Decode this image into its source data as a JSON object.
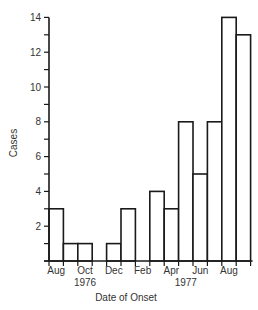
{
  "chart_data": {
    "type": "bar",
    "title": "",
    "xlabel": "Date of Onset",
    "ylabel": "Cases",
    "ylim": [
      0,
      14
    ],
    "yticks_labeled": [
      2,
      4,
      6,
      8,
      10,
      12,
      14
    ],
    "yticks_minor": [
      1,
      3,
      5,
      7,
      9,
      11,
      13
    ],
    "grid": false,
    "legend": null,
    "categories": [
      "Aug 1976",
      "Sep 1976",
      "Oct 1976",
      "Nov 1976",
      "Dec 1976",
      "Jan 1977",
      "Feb 1977",
      "Mar 1977",
      "Apr 1977",
      "May 1977",
      "Jun 1977",
      "Jul 1977",
      "Aug 1977",
      "Sep 1977"
    ],
    "values": [
      3,
      1,
      1,
      0,
      1,
      3,
      0,
      4,
      3,
      8,
      5,
      8,
      14,
      13
    ],
    "xtick_labels": [
      {
        "label": "Aug",
        "index": 0
      },
      {
        "label": "Oct",
        "index": 2
      },
      {
        "label": "Dec",
        "index": 4
      },
      {
        "label": "Feb",
        "index": 6
      },
      {
        "label": "Apr",
        "index": 8
      },
      {
        "label": "Jun",
        "index": 10
      },
      {
        "label": "Aug",
        "index": 12
      }
    ],
    "year_labels": [
      {
        "label": "1976",
        "index": 2
      },
      {
        "label": "1977",
        "index": 9
      }
    ]
  }
}
